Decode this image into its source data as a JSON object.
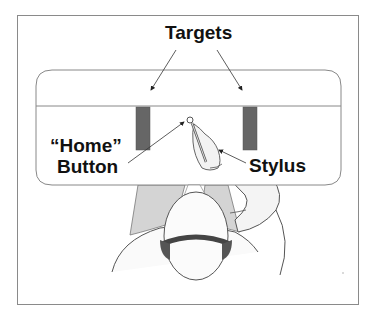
{
  "diagram": {
    "labels": {
      "targets": "Targets",
      "home": "“Home”",
      "button": "Button",
      "stylus": "Stylus"
    },
    "elements": {
      "table": "tabletop",
      "targets": [
        "left-target",
        "right-target"
      ],
      "home_button": "home-button",
      "user": "seated-user-top-view"
    },
    "colors": {
      "target_fill": "#666666",
      "outline": "#8a8a8a",
      "shirt_shading": "#d4d4d4",
      "headband": "#555555"
    }
  }
}
